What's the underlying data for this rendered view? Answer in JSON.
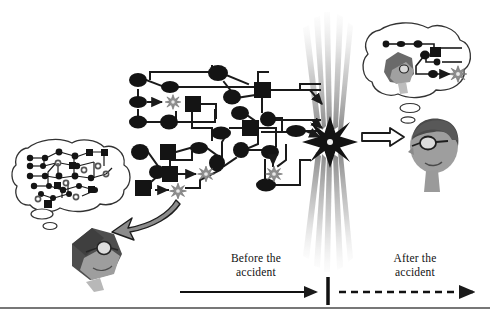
{
  "figure": {
    "type": "conceptual-diagram",
    "background_color": "#ffffff",
    "width": 490,
    "height": 316
  },
  "timeline": {
    "before_label": "Before the\naccident",
    "after_label": "After the\naccident",
    "before_arrow": {
      "style": "solid",
      "direction": "right",
      "x1": 180,
      "x2": 320,
      "y": 292
    },
    "divider": {
      "x": 328,
      "y_top": 278,
      "y_bottom": 304
    },
    "after_arrow": {
      "style": "dashed",
      "direction": "right",
      "x1": 337,
      "x2": 478,
      "y": 292
    },
    "baseline": {
      "y": 308,
      "color": "#3a3a3a"
    }
  },
  "event": {
    "name": "accident",
    "glyph": "starburst",
    "center_x": 330,
    "center_y": 142,
    "color": "#1a1a1a",
    "beam_color": "#8a8a8a"
  },
  "persons": [
    {
      "id": "person-before",
      "position": "left",
      "description": "head with glasses, tilted",
      "thought_bubble": "dense-network",
      "arrow": "curved-arrow-down-left",
      "colors": {
        "hair": "#4e4e4e",
        "face": "#9a9a9a",
        "glasses": "#2a2a2a"
      }
    },
    {
      "id": "person-after",
      "position": "right",
      "description": "head with glasses facing left",
      "thought_bubble": "sparse-network",
      "arrow": "block-arrow-right",
      "colors": {
        "hair": "#585858",
        "face": "#a8a8a8",
        "glasses": "#1e1e1e"
      }
    }
  ],
  "network": {
    "node_types": [
      "ellipse",
      "square",
      "starburst"
    ],
    "node_color": "#141414",
    "starburst_color": "#8f8f8f",
    "edge_color": "#1a1a1a",
    "edge_width": 2,
    "main_nodes": [
      {
        "shape": "ellipse",
        "x": 138,
        "y": 80
      },
      {
        "shape": "ellipse",
        "x": 170,
        "y": 87
      },
      {
        "shape": "ellipse",
        "x": 218,
        "y": 75
      },
      {
        "shape": "ellipse",
        "x": 137,
        "y": 102
      },
      {
        "shape": "starburst",
        "x": 173,
        "y": 102
      },
      {
        "shape": "square",
        "x": 192,
        "y": 104
      },
      {
        "shape": "ellipse",
        "x": 138,
        "y": 122
      },
      {
        "shape": "ellipse",
        "x": 169,
        "y": 121
      },
      {
        "shape": "square",
        "x": 262,
        "y": 90
      },
      {
        "shape": "ellipse",
        "x": 228,
        "y": 97
      },
      {
        "shape": "ellipse",
        "x": 238,
        "y": 112
      },
      {
        "shape": "square",
        "x": 250,
        "y": 128
      },
      {
        "shape": "ellipse",
        "x": 268,
        "y": 120
      },
      {
        "shape": "ellipse",
        "x": 222,
        "y": 132
      },
      {
        "shape": "ellipse",
        "x": 295,
        "y": 131
      },
      {
        "shape": "ellipse",
        "x": 140,
        "y": 152
      },
      {
        "shape": "square",
        "x": 168,
        "y": 152
      },
      {
        "shape": "ellipse",
        "x": 198,
        "y": 148
      },
      {
        "shape": "square",
        "x": 170,
        "y": 174
      },
      {
        "shape": "starburst",
        "x": 203,
        "y": 174
      },
      {
        "shape": "ellipse",
        "x": 157,
        "y": 172
      },
      {
        "shape": "square",
        "x": 143,
        "y": 188
      },
      {
        "shape": "starburst",
        "x": 176,
        "y": 190
      },
      {
        "shape": "ellipse",
        "x": 217,
        "y": 163
      },
      {
        "shape": "ellipse",
        "x": 240,
        "y": 150
      },
      {
        "shape": "ellipse",
        "x": 270,
        "y": 152
      },
      {
        "shape": "starburst",
        "x": 273,
        "y": 173
      },
      {
        "shape": "ellipse",
        "x": 265,
        "y": 185
      }
    ]
  },
  "bubble_left": {
    "outline_color": "#333333",
    "tails": 2,
    "content": "dense interconnected network of circles, squares and rings"
  },
  "bubble_right": {
    "outline_color": "#333333",
    "tails": 2,
    "content": "sparse chain of nodes ending in a starburst"
  }
}
